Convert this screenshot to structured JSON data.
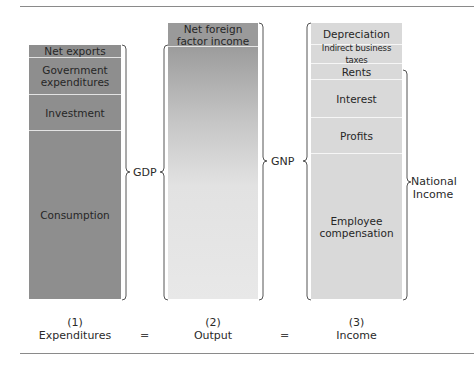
{
  "diagram": {
    "columns": [
      {
        "number": "(1)",
        "name": "Expenditures",
        "segments": [
          {
            "label": "Net exports"
          },
          {
            "label": "Government expenditures"
          },
          {
            "label": "Investment"
          },
          {
            "label": "Consumption"
          }
        ]
      },
      {
        "number": "(2)",
        "name": "Output",
        "segments": [
          {
            "label": "Net foreign factor income"
          },
          {
            "label": ""
          }
        ]
      },
      {
        "number": "(3)",
        "name": "Income",
        "segments": [
          {
            "label": "Depreciation"
          },
          {
            "label": "Indirect business taxes"
          },
          {
            "label": "Rents"
          },
          {
            "label": "Interest"
          },
          {
            "label": "Profits"
          },
          {
            "label": "Employee compensation"
          }
        ]
      }
    ],
    "braces": {
      "gdp": "GDP",
      "gnp": "GNP",
      "national_income_line1": "National",
      "national_income_line2": "Income"
    },
    "equals": "=",
    "colors": {
      "expenditures": "#8e8e8e",
      "output_top": "#9c9c9c",
      "output_bottom": "#e8e8e8",
      "income": "#d9d9d9",
      "rule": "#8a8a8a"
    }
  }
}
